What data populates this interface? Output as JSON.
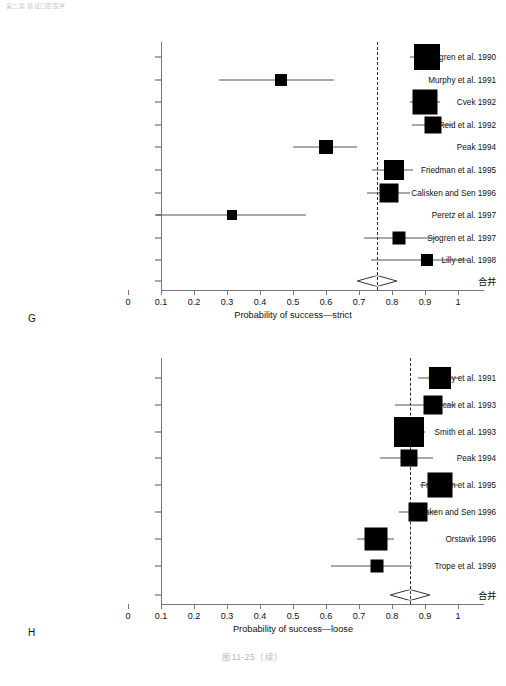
{
  "page": {
    "header_text": "第二篇  循证口腔医学",
    "caption": "图11-25（续）",
    "background": "#ffffff",
    "marker_color": "#000000",
    "axis_color": "#777777",
    "refline_color": "#2b2b2b"
  },
  "chart_data": [
    {
      "type": "forest",
      "panel_letter": "G",
      "title": "",
      "xlabel": "Probability of success—strict",
      "ylabel": "",
      "xlim": [
        0,
        1.08
      ],
      "xticks": [
        0,
        0.1,
        0.2,
        0.3,
        0.4,
        0.5,
        0.6,
        0.7,
        0.8,
        0.9,
        1
      ],
      "xticklabels": [
        "0",
        "0.1",
        "0.2",
        "0.3",
        "0.4",
        "0.5",
        "0.6",
        "0.7",
        "0.8",
        "0.9",
        "1"
      ],
      "grid": false,
      "reference_line": 0.755,
      "legend": "none",
      "rows": [
        {
          "label": "Sjogren et al. 1990",
          "estimate": 0.905,
          "ci_low": 0.855,
          "ci_high": 0.945,
          "weight": 1.0
        },
        {
          "label": "Murphy et al. 1991",
          "estimate": 0.465,
          "ci_low": 0.275,
          "ci_high": 0.625,
          "weight": 0.2
        },
        {
          "label": "Cvek 1992",
          "estimate": 0.9,
          "ci_low": 0.855,
          "ci_high": 0.945,
          "weight": 0.95
        },
        {
          "label": "Reid et al. 1992",
          "estimate": 0.925,
          "ci_low": 0.86,
          "ci_high": 0.985,
          "weight": 0.42
        },
        {
          "label": "Peak 1994",
          "estimate": 0.6,
          "ci_low": 0.5,
          "ci_high": 0.695,
          "weight": 0.3
        },
        {
          "label": "Friedman et al. 1995",
          "estimate": 0.805,
          "ci_low": 0.74,
          "ci_high": 0.865,
          "weight": 0.62
        },
        {
          "label": "Calisken and Sen 1996",
          "estimate": 0.79,
          "ci_low": 0.725,
          "ci_high": 0.855,
          "weight": 0.55
        },
        {
          "label": "Peretz et al. 1997",
          "estimate": 0.315,
          "ci_low": 0.085,
          "ci_high": 0.54,
          "weight": 0.16
        },
        {
          "label": "Sjogren et al. 1997",
          "estimate": 0.82,
          "ci_low": 0.715,
          "ci_high": 0.935,
          "weight": 0.24
        },
        {
          "label": "Lilly et al. 1998",
          "estimate": 0.905,
          "ci_low": 0.735,
          "ci_high": 1.03,
          "weight": 0.2
        }
      ],
      "pooled": {
        "label": "合并",
        "estimate": 0.755,
        "ci_low": 0.695,
        "ci_high": 0.815
      }
    },
    {
      "type": "forest",
      "panel_letter": "H",
      "title": "",
      "xlabel": "Probability of success—loose",
      "ylabel": "",
      "xlim": [
        0,
        1.08
      ],
      "xticks": [
        0,
        0.1,
        0.2,
        0.3,
        0.4,
        0.5,
        0.6,
        0.7,
        0.8,
        0.9,
        1
      ],
      "xticklabels": [
        "0",
        "0.1",
        "0.2",
        "0.3",
        "0.4",
        "0.5",
        "0.6",
        "0.7",
        "0.8",
        "0.9",
        "1"
      ],
      "grid": false,
      "reference_line": 0.855,
      "legend": "none",
      "rows": [
        {
          "label": "Murphy et al. 1991",
          "estimate": 0.945,
          "ci_low": 0.88,
          "ci_high": 1.005,
          "weight": 0.55
        },
        {
          "label": "Jurcak et al. 1993",
          "estimate": 0.925,
          "ci_low": 0.81,
          "ci_high": 0.995,
          "weight": 0.42
        },
        {
          "label": "Smith et al. 1993",
          "estimate": 0.85,
          "ci_low": 0.81,
          "ci_high": 0.9,
          "weight": 1.0
        },
        {
          "label": "Peak 1994",
          "estimate": 0.85,
          "ci_low": 0.765,
          "ci_high": 0.925,
          "weight": 0.34
        },
        {
          "label": "Friedman et al. 1995",
          "estimate": 0.945,
          "ci_low": 0.885,
          "ci_high": 1.0,
          "weight": 0.72
        },
        {
          "label": "Calisken and Sen 1996",
          "estimate": 0.88,
          "ci_low": 0.82,
          "ci_high": 0.935,
          "weight": 0.4
        },
        {
          "label": "Orstavik 1996",
          "estimate": 0.75,
          "ci_low": 0.695,
          "ci_high": 0.805,
          "weight": 0.6
        },
        {
          "label": "Trope et al. 1999",
          "estimate": 0.755,
          "ci_low": 0.615,
          "ci_high": 0.86,
          "weight": 0.18
        }
      ],
      "pooled": {
        "label": "合并",
        "estimate": 0.855,
        "ci_low": 0.795,
        "ci_high": 0.915
      }
    }
  ]
}
